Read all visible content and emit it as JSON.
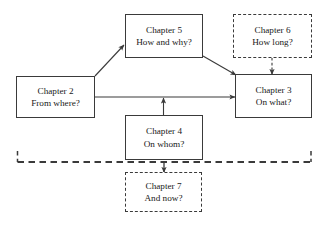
{
  "diagram": {
    "background_color": "#ffffff",
    "stroke_color": "#3a3a3a",
    "text_color": "#1a1a1a",
    "nodes": [
      {
        "id": "chapter2",
        "line1": "Chapter 2",
        "line2": "From where?",
        "style": "solid",
        "x": 16,
        "y": 76,
        "w": 79,
        "h": 42
      },
      {
        "id": "chapter5",
        "line1": "Chapter 5",
        "line2": "How and why?",
        "style": "solid",
        "x": 125,
        "y": 14,
        "w": 78,
        "h": 44
      },
      {
        "id": "chapter6",
        "line1": "Chapter 6",
        "line2": "How long?",
        "style": "dashed",
        "x": 233,
        "y": 14,
        "w": 79,
        "h": 44
      },
      {
        "id": "chapter3",
        "line1": "Chapter 3",
        "line2": "On what?",
        "style": "solid",
        "x": 235,
        "y": 74,
        "w": 77,
        "h": 44
      },
      {
        "id": "chapter4",
        "line1": "Chapter 4",
        "line2": "On whom?",
        "style": "solid",
        "x": 125,
        "y": 115,
        "w": 78,
        "h": 45
      },
      {
        "id": "chapter7",
        "line1": "Chapter 7",
        "line2": "And now?",
        "style": "dashed",
        "x": 125,
        "y": 172,
        "w": 77,
        "h": 40
      }
    ],
    "edges": [
      {
        "id": "ch2-to-ch5",
        "from": "chapter2",
        "to": "chapter5",
        "style": "solid",
        "arrow": true
      },
      {
        "id": "ch5-to-ch3",
        "from": "chapter5",
        "to": "chapter3",
        "style": "solid",
        "arrow": true
      },
      {
        "id": "ch2-to-ch3",
        "from": "chapter2",
        "to": "chapter3",
        "style": "solid",
        "arrow": true
      },
      {
        "id": "ch4-to-ch2ch3-link",
        "from": "chapter4",
        "to": "ch2-to-ch3",
        "style": "solid",
        "arrow": true
      },
      {
        "id": "ch6-to-ch3",
        "from": "chapter6",
        "to": "chapter3",
        "style": "dashed",
        "arrow": true
      },
      {
        "id": "ch3ch2-bracket-to-ch7",
        "from": "chapter2-and-chapter3",
        "to": "chapter7",
        "style": "dashed",
        "arrow": true
      }
    ]
  }
}
